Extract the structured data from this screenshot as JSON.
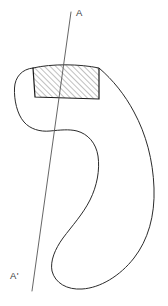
{
  "figure": {
    "type": "engineering-cross-section-diagram",
    "background_color": "#ffffff",
    "outline_color": "#2b2b2b",
    "section_line_color": "#555555",
    "hatch_color": "#4a4a4a",
    "region_edge_color": "#1a1a1a"
  },
  "labels": {
    "section_top": "A",
    "section_bottom": "A'"
  },
  "section_line": {
    "name": "section-cut-line",
    "start_x": 71,
    "start_y": 12,
    "end_x": 32,
    "end_y": 291
  },
  "hatched_region": {
    "name": "cross-hatched-section-area",
    "hatch_angle_degrees": 45,
    "hatch_spacing_px": 4,
    "corners": [
      [
        33,
        68
      ],
      [
        99,
        68
      ],
      [
        99,
        99
      ],
      [
        35,
        97
      ]
    ]
  },
  "outline": {
    "name": "part-outline",
    "closed": true
  }
}
